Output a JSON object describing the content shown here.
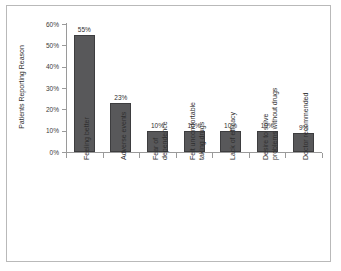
{
  "chart_data": {
    "type": "bar",
    "title": "",
    "xlabel": "",
    "ylabel": "Patients Reporting Reason",
    "ylim": [
      0,
      60
    ],
    "ytick_labels": [
      "0%",
      "10%",
      "20%",
      "30%",
      "40%",
      "50%",
      "60%"
    ],
    "ytick_values": [
      0,
      10,
      20,
      30,
      40,
      50,
      60
    ],
    "grid": false,
    "legend": false,
    "bar_color": "#58585a",
    "bar_edge_color": "#3d3d3f",
    "axis_color": "#9a9a9a",
    "frame_color": "#b9b9b9",
    "background": "#ffffff",
    "categories": [
      "Feeling better",
      "Adverse events",
      "Fear of dependence",
      "Felt uncomfortable taking drugs",
      "Lack of efficacy",
      "Desire to solve problems without drugs",
      "Doctor recommended"
    ],
    "category_lines": [
      [
        "Feeling better"
      ],
      [
        "Adverse events"
      ],
      [
        "Fear of",
        "dependence"
      ],
      [
        "Felt uncomfortable",
        "taking drugs"
      ],
      [
        "Lack of efficacy"
      ],
      [
        "Desire to solve",
        "problems without drugs"
      ],
      [
        "Doctor recommended"
      ]
    ],
    "values": [
      55,
      23,
      10,
      10,
      10,
      10,
      9
    ],
    "data_labels": [
      "55%",
      "23%",
      "10%",
      "10%",
      "10%",
      "10%",
      "9%"
    ]
  }
}
